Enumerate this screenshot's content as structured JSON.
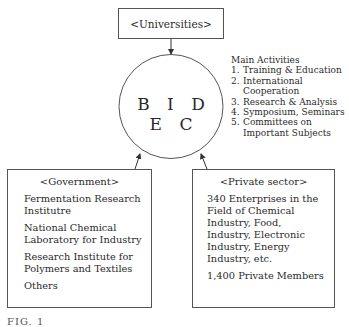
{
  "diagram": {
    "center": {
      "label": "B I D E C"
    },
    "top_node": {
      "label": "<Universities>"
    },
    "activities": {
      "heading": "Main Activities",
      "items": [
        {
          "num": "1.",
          "text": "Training & Education"
        },
        {
          "num": "2.",
          "text": "International Cooperation"
        },
        {
          "num": "3.",
          "text": "Research & Analysis"
        },
        {
          "num": "4.",
          "text": "Symposium, Seminars"
        },
        {
          "num": "5.",
          "text": "Committees on Important Subjects"
        }
      ]
    },
    "government": {
      "title": "<Government>",
      "entries": [
        "Fermentation Research Institutre",
        "National Chemical Laboratory for Industry",
        "Research Institute for Polymers and Textiles",
        "Others"
      ]
    },
    "private_sector": {
      "title": "<Private sector>",
      "entries": [
        "340 Enterprises in the Field of Chemical Industry, Food, Industry, Electronic Industry, Energy Industry, etc.",
        "1,400 Private Members"
      ]
    },
    "caption": "FIG. 1",
    "colors": {
      "line": "#555555",
      "text": "#2a2a2a",
      "background": "#ffffff"
    }
  }
}
